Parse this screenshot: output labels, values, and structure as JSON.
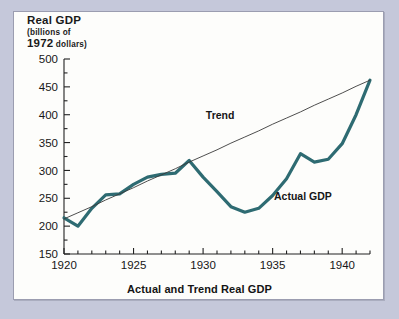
{
  "figure": {
    "caption": "Actual and Trend Real GDP",
    "background_color": "#c5c8da",
    "panel_color": "#fdfdfb",
    "border_color": "#9b9db0"
  },
  "axis_title": {
    "line1": "Real GDP",
    "line2": "(billions of",
    "line3_num": "1972",
    "line3_rest": " dollars)"
  },
  "chart_data": {
    "type": "line",
    "title": "Actual and Trend Real GDP",
    "xlabel": "",
    "ylabel": "Real GDP (billions of 1972 dollars)",
    "xlim": [
      1920,
      1942
    ],
    "ylim": [
      150,
      500
    ],
    "grid": false,
    "legend": "inline-annotations",
    "y_major_ticks": [
      150,
      200,
      250,
      300,
      350,
      400,
      450,
      500
    ],
    "y_minor_step": 25,
    "x_major_ticks": [
      1920,
      1925,
      1930,
      1935,
      1940
    ],
    "x_minor_step": 1,
    "y_tick_labels": [
      "150",
      "200",
      "250",
      "300",
      "350",
      "400",
      "450",
      "500"
    ],
    "x_tick_labels": [
      "1920",
      "1925",
      "1930",
      "1935",
      "1940"
    ],
    "x": [
      1920,
      1921,
      1922,
      1923,
      1924,
      1925,
      1926,
      1927,
      1928,
      1929,
      1930,
      1931,
      1932,
      1933,
      1934,
      1935,
      1936,
      1937,
      1938,
      1939,
      1940,
      1941,
      1942
    ],
    "series": [
      {
        "name": "Actual GDP",
        "color": "#2e6b72",
        "width": 3.2,
        "label_x": 1935.1,
        "label_y": 247,
        "values": [
          215,
          200,
          232,
          256,
          258,
          275,
          288,
          293,
          295,
          318,
          288,
          262,
          235,
          225,
          232,
          255,
          285,
          330,
          315,
          320,
          348,
          400,
          462
        ]
      },
      {
        "name": "Trend",
        "color": "#3a3a3a",
        "width": 0.9,
        "label_x": 1930.2,
        "label_y": 392,
        "values": [
          213,
          224,
          235,
          247,
          258,
          269,
          281,
          292,
          303,
          315,
          326,
          337,
          349,
          360,
          371,
          383,
          394,
          405,
          417,
          428,
          439,
          451,
          462
        ]
      }
    ]
  }
}
